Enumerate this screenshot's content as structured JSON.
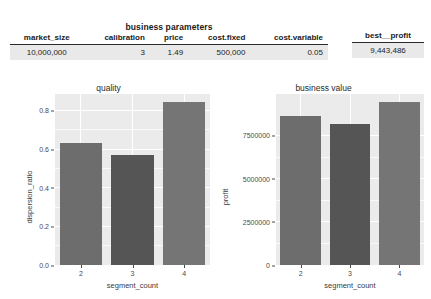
{
  "tables": {
    "main": {
      "title": "business parameters",
      "headers": [
        "market_size",
        "calibration",
        "price",
        "cost.fixed",
        "cost.variable"
      ],
      "rows": [
        [
          "10,000,000",
          "3",
          "1.49",
          "500,000",
          "0.05"
        ]
      ]
    },
    "profit": {
      "headers": [
        "best__profit"
      ],
      "rows": [
        [
          "9,443,486"
        ]
      ]
    }
  },
  "chart_data": [
    {
      "type": "bar",
      "title": "quality",
      "xlabel": "segment_count",
      "ylabel": "dispersion_ratio",
      "categories": [
        "2",
        "3",
        "4"
      ],
      "values": [
        0.632,
        0.571,
        0.845
      ],
      "ylim": [
        0.0,
        0.885
      ],
      "yticks": [
        0.0,
        0.2,
        0.4,
        0.6,
        0.8
      ],
      "ytick_labels": [
        "0.0",
        "0.2",
        "0.4",
        "0.6",
        "0.8"
      ],
      "grid": true,
      "legend": "none",
      "bar_colors": [
        "#6d6d6d",
        "#555555",
        "#757575"
      ],
      "panel_color": "#ebebeb",
      "grid_color": "#ffffff"
    },
    {
      "type": "bar",
      "title": "business value",
      "xlabel": "segment_count",
      "ylabel": "profit",
      "categories": [
        "2",
        "3",
        "4"
      ],
      "values": [
        8650000,
        8150000,
        9443486
      ],
      "ylim": [
        0,
        9900000
      ],
      "yticks": [
        0,
        2500000,
        5000000,
        7500000
      ],
      "ytick_labels": [
        "0",
        "2500000",
        "5000000",
        "7500000"
      ],
      "grid": true,
      "legend": "none",
      "bar_colors": [
        "#6d6d6d",
        "#555555",
        "#757575"
      ],
      "panel_color": "#ebebeb",
      "grid_color": "#ffffff"
    }
  ]
}
